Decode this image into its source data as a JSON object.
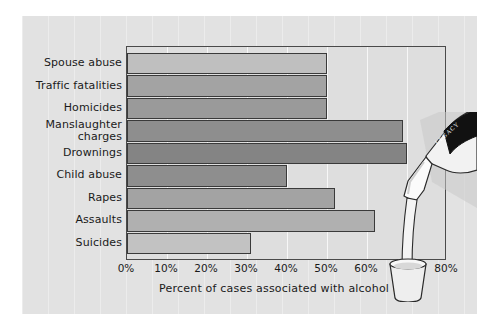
{
  "figure": {
    "background_color": "#e2e2e2",
    "plot_background_color": "#dedede",
    "frame_color": "#4a4a4a"
  },
  "illustration": {
    "name": "bottle-pouring-into-glass",
    "bottle_label_text": "LEGACY"
  },
  "chart_data": {
    "type": "bar",
    "orientation": "horizontal",
    "title": "",
    "subtitle": "",
    "xlabel": "Percent of cases associated with alcohol use",
    "ylabel": "",
    "xlim": [
      0,
      80
    ],
    "grid": true,
    "legend": "none",
    "tick_labels": [
      "0%",
      "10%",
      "20%",
      "30%",
      "40%",
      "50%",
      "60%",
      "70%",
      "80%"
    ],
    "tick_values": [
      0,
      10,
      20,
      30,
      40,
      50,
      60,
      70,
      80
    ],
    "categories": [
      "Spouse abuse",
      "Traffic fatalities",
      "Homicides",
      "Manslaughter\ncharges",
      "Drownings",
      "Child abuse",
      "Rapes",
      "Assaults",
      "Suicides"
    ],
    "values": [
      50,
      50,
      50,
      69,
      70,
      40,
      52,
      62,
      31
    ],
    "bar_colors": [
      "#bfbfbf",
      "#a3a3a3",
      "#9a9a9a",
      "#8e8e8e",
      "#848484",
      "#8e8e8e",
      "#a3a3a3",
      "#b0b0b0",
      "#c2c2c2"
    ]
  }
}
